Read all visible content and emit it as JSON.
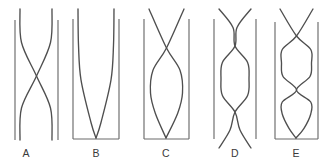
{
  "figure": {
    "background_color": "#ffffff",
    "rail_color": "#6b6b6b",
    "strand_color": "#4f4f4f",
    "label_color": "#3a3a3a",
    "width": 328,
    "height": 166
  },
  "panels": [
    {
      "id": "A",
      "label": "A",
      "label_x": 26,
      "label_y": 157,
      "crossings": 1,
      "lenses": 0,
      "has_base_bar": false,
      "strands_extend_past_rails": true,
      "rail_left_x": 15,
      "rail_right_x": 58,
      "rail_top_y": 20,
      "rail_bottom_y": 140,
      "strand_top_y": 9,
      "strand_bottom_y": 140,
      "strand_left_top_x": 20,
      "strand_right_top_x": 52,
      "strand_left_bottom_x": 52,
      "strand_right_bottom_x": 20,
      "crossing_y": 76,
      "description": "Two nearly straight strands crossing once at mid height between two vertical rails; no bottom bar."
    },
    {
      "id": "B",
      "label": "B",
      "label_x": 96,
      "label_y": 157,
      "crossings": 0,
      "lenses": 0,
      "has_base_bar": true,
      "strands_extend_past_rails": true,
      "rail_left_x": 73,
      "rail_right_x": 119,
      "rail_top_y": 19,
      "rail_bottom_y": 139,
      "base_y": 139,
      "strand_top_y": 9,
      "strand_bottom_y": 138,
      "strand_left_top_x": 78,
      "strand_right_top_x": 114,
      "converge_x": 96,
      "description": "Two strands curving inward to meet at the bottom centre on a base bar; no crossing."
    },
    {
      "id": "C",
      "label": "C",
      "label_x": 166,
      "label_y": 157,
      "crossings": 1,
      "lenses": 1,
      "has_base_bar": true,
      "strands_extend_past_rails": true,
      "rail_left_x": 144,
      "rail_right_x": 189,
      "rail_top_y": 19,
      "rail_bottom_y": 139,
      "base_y": 139,
      "strand_top_y": 9,
      "strand_bottom_y": 138,
      "strand_left_top_x": 149,
      "strand_right_top_x": 184,
      "crossing_y": 48,
      "converge_x": 166,
      "lens_center_y": 93,
      "lens_half_width": 16,
      "description": "Strands cross once high up, bulge into a single lens, then converge at the bottom centre on a base bar."
    },
    {
      "id": "D",
      "label": "D",
      "label_x": 235,
      "label_y": 157,
      "crossings": 2,
      "lenses": 1,
      "has_base_bar": false,
      "strands_extend_past_rails": true,
      "rail_left_x": 214,
      "rail_right_x": 256,
      "rail_top_y": 19,
      "rail_bottom_y": 139,
      "strand_top_y": 9,
      "strand_bottom_y": 148,
      "strand_left_top_x": 219,
      "strand_right_top_x": 251,
      "upper_crossing_y": 46,
      "lower_crossing_y": 112,
      "lens_center_y": 79,
      "lens_half_width": 14,
      "description": "Two strands cross twice enclosing a lens in the middle; strands run past the rails top and bottom, no base bar."
    },
    {
      "id": "E",
      "label": "E",
      "label_x": 296,
      "label_y": 157,
      "crossings": 2,
      "lenses": 2,
      "has_base_bar": true,
      "strands_extend_past_rails": true,
      "rail_left_x": 275,
      "rail_right_x": 318,
      "rail_top_y": 22,
      "rail_bottom_y": 139,
      "base_y": 139,
      "strand_top_y": 9,
      "strand_bottom_y": 138,
      "strand_left_top_x": 280,
      "strand_right_top_x": 313,
      "upper_crossing_y": 36,
      "middle_crossing_y": 90,
      "upper_lens_center_y": 63,
      "lower_lens_center_y": 114,
      "lens_half_width": 15,
      "converge_x": 296,
      "description": "Strands cross near the top, form a lens, cross again mid-height, form a second lens, then converge at the bottom centre on a base bar."
    }
  ]
}
